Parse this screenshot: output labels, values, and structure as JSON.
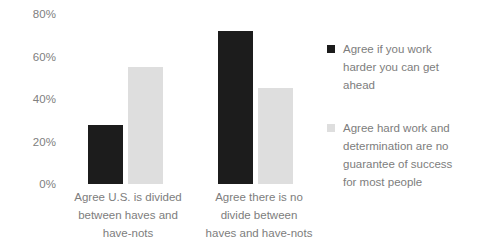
{
  "chart_data": {
    "type": "bar",
    "title": "",
    "xlabel": "",
    "ylabel": "",
    "ylim": [
      0,
      80
    ],
    "grid": false,
    "legend_position": "right",
    "y_ticks": [
      "0%",
      "20%",
      "40%",
      "60%",
      "80%"
    ],
    "y_tick_values": [
      0,
      20,
      40,
      60,
      80
    ],
    "categories": [
      "Agree U.S. is divided between haves and have-nots",
      "Agree there is no divide between haves and have-nots"
    ],
    "category_lines": [
      [
        "Agree U.S. is divided",
        "between haves and",
        "have-nots"
      ],
      [
        "Agree there is no",
        "divide between",
        "haves and have-nots"
      ]
    ],
    "series": [
      {
        "name": "Agree if you work harder you can get ahead",
        "name_lines": [
          "Agree if you work",
          "harder you can get",
          "ahead"
        ],
        "color": "#1c1c1c",
        "values": [
          28,
          72
        ]
      },
      {
        "name": "Agree hard work and determination are no guarantee of success for most people",
        "name_lines": [
          "Agree hard work and",
          "determination are no",
          "guarantee of success",
          "for most people"
        ],
        "color": "#dedede",
        "values": [
          55,
          45
        ]
      }
    ]
  }
}
